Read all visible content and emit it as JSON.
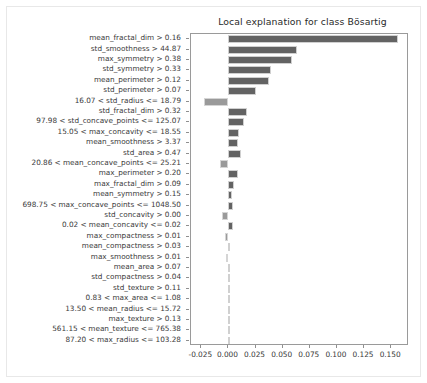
{
  "chart_data": {
    "type": "bar",
    "orientation": "horizontal",
    "title": "Local explanation for class Bösartig",
    "xlabel": "",
    "ylabel": "",
    "xlim": [
      -0.0345,
      0.1665
    ],
    "xticks": [
      -0.025,
      0.0,
      0.025,
      0.05,
      0.075,
      0.1,
      0.125,
      0.15
    ],
    "xticklabels": [
      "-0.025",
      "0.000",
      "0.025",
      "0.050",
      "0.075",
      "0.100",
      "0.125",
      "0.150"
    ],
    "grid": false,
    "legend": null,
    "bar_color_positive": "#636363",
    "bar_color_negative": "#9a9a9a",
    "categories": [
      "mean_fractal_dim > 0.16",
      "std_smoothness > 44.87",
      "max_symmetry > 0.38",
      "std_symmetry > 0.33",
      "mean_perimeter > 0.12",
      "std_perimeter > 0.07",
      "16.07 < std_radius <= 18.79",
      "std_fractal_dim > 0.32",
      "97.98 < std_concave_points <= 125.07",
      "15.05 < max_concavity <= 18.55",
      "mean_smoothness > 3.37",
      "std_area > 0.47",
      "20.86 < mean_concave_points <= 25.21",
      "max_perimeter > 0.20",
      "max_fractal_dim > 0.09",
      "mean_symmetry > 0.15",
      "698.75 < max_concave_points <= 1048.50",
      "std_concavity > 0.00",
      "0.02 < mean_concavity <= 0.02",
      "max_compactness > 0.01",
      "mean_compactness > 0.03",
      "max_smoothness > 0.01",
      "mean_area > 0.07",
      "std_compactness > 0.04",
      "std_texture > 0.11",
      "0.83 < max_area <= 1.08",
      "13.50 < mean_radius <= 15.72",
      "max_texture > 0.13",
      "561.15 < mean_texture <= 765.38",
      "87.20 < max_radius <= 103.28"
    ],
    "values": [
      0.1565,
      0.0632,
      0.0585,
      0.0395,
      0.0375,
      0.0255,
      -0.0225,
      0.0175,
      0.0145,
      0.0095,
      0.0092,
      0.0112,
      -0.0082,
      0.0085,
      0.0055,
      0.0032,
      0.004,
      -0.0055,
      0.0042,
      -0.0028,
      0.0018,
      -0.0018,
      0.0014,
      0.0012,
      0.0009,
      0.0007,
      0.0005,
      0.0004,
      0.0003,
      0.0002
    ]
  }
}
